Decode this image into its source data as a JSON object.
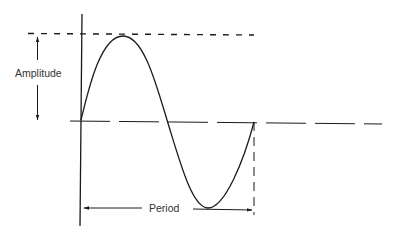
{
  "diagram": {
    "type": "sine-wave-annotation",
    "labels": {
      "amplitude": "Amplitude",
      "period": "Period"
    },
    "colors": {
      "stroke": "#1a1a1a",
      "text": "#333333",
      "background": "#ffffff"
    }
  }
}
